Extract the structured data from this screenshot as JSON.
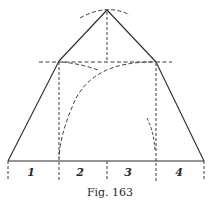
{
  "figure": {
    "caption": "Fig. 163",
    "segments": [
      {
        "label": "1"
      },
      {
        "label": "2"
      },
      {
        "label": "3"
      },
      {
        "label": "4"
      }
    ]
  },
  "colors": {
    "ink": "#2a2a2a",
    "background": "#ffffff"
  }
}
